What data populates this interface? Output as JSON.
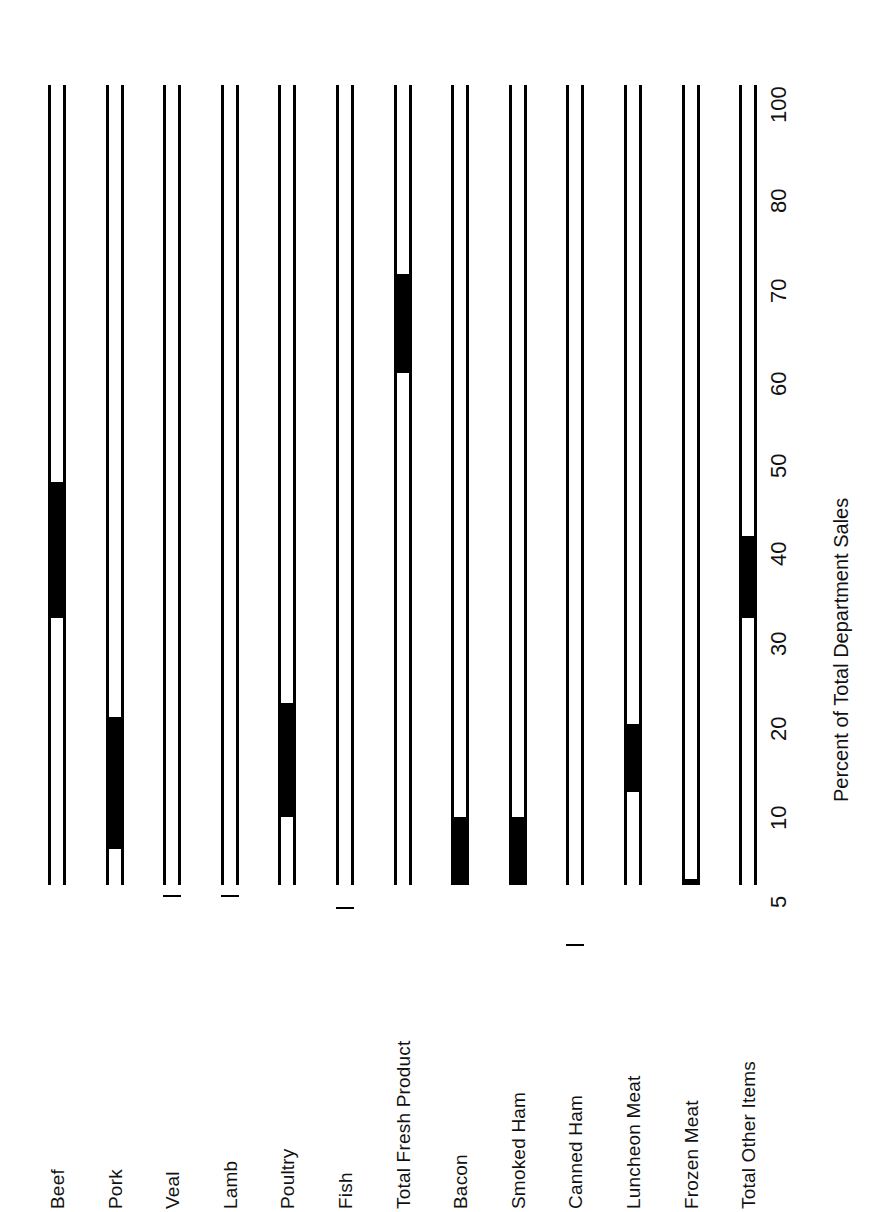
{
  "chart_data": {
    "type": "bar",
    "title": "",
    "subtitle": "",
    "xlabel": "Percent of Total Department Sales",
    "ylabel": "",
    "orientation": "horizontal-rotated",
    "grid": false,
    "legend": null,
    "axis_note": "Non-linear (probability/log-like) percent scale; bars drawn as hollow outlines with a solid black band spanning each item's range.",
    "tick_labels": [
      "5",
      "10",
      "20",
      "30",
      "40",
      "50",
      "60",
      "70",
      "80",
      "100"
    ],
    "tick_values": [
      5,
      10,
      20,
      30,
      40,
      50,
      60,
      70,
      80,
      100
    ],
    "axis_range": [
      2,
      100
    ],
    "categories": [
      "Beef",
      "Pork",
      "Veal",
      "Lamb",
      "Poultry",
      "Fish",
      "Total Fresh Product",
      "Bacon",
      "Smoked Ham",
      "Canned Ham",
      "Luncheon Meat",
      "Frozen Meat",
      "Total Other Items"
    ],
    "bands": [
      {
        "category": "Beef",
        "low": 30,
        "high": 45
      },
      {
        "category": "Pork",
        "low": 6,
        "high": 18
      },
      {
        "category": "Veal",
        "low": 2,
        "high": 4
      },
      {
        "category": "Lamb",
        "low": 2,
        "high": 4
      },
      {
        "category": "Poultry",
        "low": 8,
        "high": 20
      },
      {
        "category": "Fish",
        "low": 2,
        "high": 3.6
      },
      {
        "category": "Total Fresh Product",
        "low": 58,
        "high": 69
      },
      {
        "category": "Bacon",
        "low": 3.2,
        "high": 8
      },
      {
        "category": "Smoked Ham",
        "low": 3.2,
        "high": 8
      },
      {
        "category": "Canned Ham",
        "low": 2,
        "high": 2.6
      },
      {
        "category": "Luncheon Meat",
        "low": 10,
        "high": 17
      },
      {
        "category": "Frozen Meat",
        "low": 2.5,
        "high": 4.6
      },
      {
        "category": "Total Other Items",
        "low": 30,
        "high": 39
      }
    ],
    "values": [
      45,
      18,
      4,
      4,
      20,
      3.6,
      69,
      8,
      8,
      2.6,
      17,
      4.6,
      39
    ]
  },
  "colors": {
    "background": "#ffffff",
    "ink": "#000000",
    "bar_fill": "#000000",
    "bar_outline": "#000000",
    "text": "#111111"
  }
}
